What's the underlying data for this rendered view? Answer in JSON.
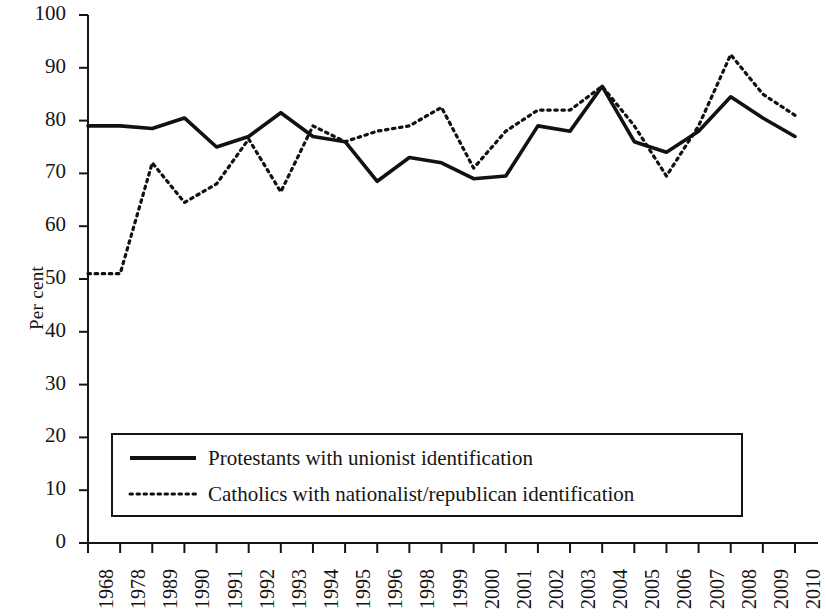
{
  "chart_data": {
    "type": "line",
    "title": "",
    "xlabel": "",
    "ylabel": "Per cent",
    "ylim": [
      0,
      100
    ],
    "ytick_step": 10,
    "grid": false,
    "legend_position": "inside-bottom-left",
    "categories": [
      "1968",
      "1978",
      "1989",
      "1990",
      "1991",
      "1992",
      "1993",
      "1994",
      "1995",
      "1996",
      "1998",
      "1999",
      "2000",
      "2001",
      "2002",
      "2003",
      "2004",
      "2005",
      "2006",
      "2007",
      "2008",
      "2009",
      "2010"
    ],
    "yticks": [
      "0",
      "10",
      "20",
      "30",
      "40",
      "50",
      "60",
      "70",
      "80",
      "90",
      "100"
    ],
    "series": [
      {
        "name": "Protestants with unionist identification",
        "style": "solid",
        "color": "#111111",
        "values": [
          79,
          79,
          78.5,
          80.5,
          75,
          77,
          81.5,
          77,
          76,
          68.5,
          73,
          72,
          69,
          69.5,
          79,
          78,
          86.5,
          76,
          74,
          78,
          84.5,
          80.5,
          77
        ]
      },
      {
        "name": "Catholics with nationalist/republican identification",
        "style": "dotted",
        "color": "#111111",
        "values": [
          51,
          51,
          72,
          64.5,
          68,
          76.5,
          66.5,
          79,
          76,
          78,
          79,
          82.5,
          71,
          78,
          82,
          82,
          86.5,
          79,
          69.5,
          79,
          92.5,
          85,
          81
        ]
      }
    ]
  },
  "legend": {
    "items": [
      {
        "label": "Protestants with unionist identification",
        "style": "solid"
      },
      {
        "label": "Catholics with nationalist/republican identification",
        "style": "dotted"
      }
    ]
  }
}
